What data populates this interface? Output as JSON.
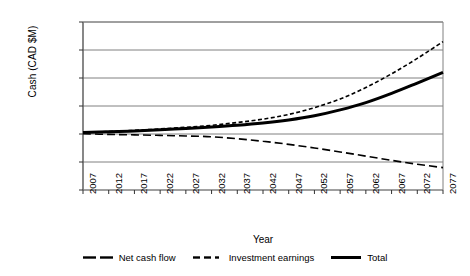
{
  "chart_data": {
    "type": "line",
    "title": "",
    "xlabel": "Year",
    "ylabel": "Cash (CAD $M)",
    "xlim": [
      2007,
      2077
    ],
    "ylim": [
      -200000,
      400000
    ],
    "grid": true,
    "legend_position": "bottom",
    "xticklabels": [
      "2007",
      "2012",
      "2017",
      "2022",
      "2027",
      "2032",
      "2037",
      "2042",
      "2047",
      "2052",
      "2057",
      "2062",
      "2067",
      "2072",
      "2077"
    ],
    "xticks": [
      2007,
      2012,
      2017,
      2022,
      2027,
      2032,
      2037,
      2042,
      2047,
      2052,
      2057,
      2062,
      2067,
      2072,
      2077
    ],
    "yticklabels": [
      "400,000",
      "300,000",
      "200,000",
      "100,000",
      "0",
      "-100,000",
      "-200,000"
    ],
    "yticks": [
      400000,
      300000,
      200000,
      100000,
      0,
      -100000,
      -200000
    ],
    "x": [
      2007,
      2012,
      2017,
      2022,
      2027,
      2032,
      2037,
      2042,
      2047,
      2052,
      2057,
      2062,
      2067,
      2072,
      2077
    ],
    "series": [
      {
        "name": "Net cash flow",
        "style": "long-dash",
        "values": [
          1000,
          -1500,
          -3000,
          -5000,
          -7000,
          -10000,
          -17000,
          -26000,
          -37000,
          -50000,
          -64000,
          -79000,
          -94000,
          -108000,
          -120000
        ]
      },
      {
        "name": "Investment earnings",
        "style": "short-dash",
        "values": [
          6000,
          9000,
          13000,
          18000,
          24000,
          31000,
          41000,
          53000,
          70000,
          94000,
          125000,
          166000,
          215000,
          270000,
          330000
        ]
      },
      {
        "name": "Total",
        "style": "solid",
        "values": [
          5000,
          8000,
          11000,
          15000,
          20000,
          25000,
          31000,
          39000,
          50000,
          65000,
          86000,
          112000,
          145000,
          182000,
          220000
        ]
      }
    ]
  },
  "legend": {
    "items": [
      {
        "label": "Net cash flow",
        "key": "long-dash-key"
      },
      {
        "label": "Investment earnings",
        "key": "short-dash-key"
      },
      {
        "label": "Total",
        "key": "solid-key"
      }
    ]
  }
}
